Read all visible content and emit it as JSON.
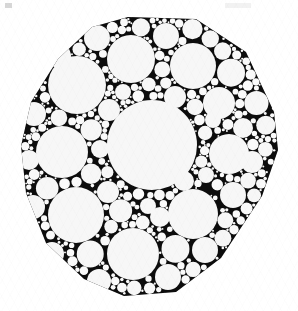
{
  "figure": {
    "kind": "circle-packing-diagram",
    "caption": "",
    "canvas": {
      "width": 298,
      "height": 311
    },
    "colors": {
      "ink": "#080808",
      "paper": "#ffffff",
      "disk_fill": "#f7f7f7",
      "disk_fill_small": "#fafafa",
      "texture": "#f2f2f2"
    },
    "outline": {
      "label": "hexagonal packing boundary",
      "points": [
        [
          128,
          17
        ],
        [
          196,
          19
        ],
        [
          246,
          52
        ],
        [
          274,
          112
        ],
        [
          278,
          150
        ],
        [
          262,
          196
        ],
        [
          221,
          258
        ],
        [
          176,
          292
        ],
        [
          124,
          296
        ],
        [
          84,
          279
        ],
        [
          46,
          243
        ],
        [
          26,
          193
        ],
        [
          21,
          146
        ],
        [
          31,
          102
        ],
        [
          58,
          59
        ],
        [
          92,
          27
        ]
      ]
    },
    "background_fill_radius": 0,
    "artifacts": [
      {
        "name": "scan-speck-top-left",
        "x": 5,
        "y": 3,
        "w": 7,
        "h": 5,
        "opacity": 0.16
      },
      {
        "name": "scan-smudge-top-right",
        "x": 225,
        "y": 3,
        "w": 26,
        "h": 5,
        "opacity": 0.05
      }
    ],
    "disks": [
      {
        "cx": 152,
        "cy": 145,
        "r": 45,
        "tier": "primary"
      },
      {
        "cx": 77,
        "cy": 85,
        "r": 29,
        "tier": "primary"
      },
      {
        "cx": 131,
        "cy": 59,
        "r": 24,
        "tier": "primary"
      },
      {
        "cx": 193,
        "cy": 66,
        "r": 23,
        "tier": "primary"
      },
      {
        "cx": 62,
        "cy": 152,
        "r": 26,
        "tier": "primary"
      },
      {
        "cx": 76,
        "cy": 215,
        "r": 28,
        "tier": "primary"
      },
      {
        "cx": 133,
        "cy": 254,
        "r": 26,
        "tier": "primary"
      },
      {
        "cx": 193,
        "cy": 214,
        "r": 25,
        "tier": "primary"
      },
      {
        "cx": 229,
        "cy": 154,
        "r": 20,
        "tier": "primary"
      },
      {
        "cx": 97,
        "cy": 38,
        "r": 13,
        "tier": "secondary"
      },
      {
        "cx": 166,
        "cy": 36,
        "r": 13,
        "tier": "secondary"
      },
      {
        "cx": 219,
        "cy": 103,
        "r": 16,
        "tier": "secondary"
      },
      {
        "cx": 243,
        "cy": 128,
        "r": 10,
        "tier": "secondary"
      },
      {
        "cx": 252,
        "cy": 162,
        "r": 11,
        "tier": "secondary"
      },
      {
        "cx": 233,
        "cy": 195,
        "r": 13,
        "tier": "secondary"
      },
      {
        "cx": 205,
        "cy": 250,
        "r": 13,
        "tier": "secondary"
      },
      {
        "cx": 168,
        "cy": 277,
        "r": 13,
        "tier": "secondary"
      },
      {
        "cx": 99,
        "cy": 281,
        "r": 12,
        "tier": "secondary"
      },
      {
        "cx": 52,
        "cy": 254,
        "r": 12,
        "tier": "secondary"
      },
      {
        "cx": 33,
        "cy": 207,
        "r": 12,
        "tier": "secondary"
      },
      {
        "cx": 29,
        "cy": 160,
        "r": 10,
        "tier": "secondary"
      },
      {
        "cx": 34,
        "cy": 114,
        "r": 12,
        "tier": "secondary"
      },
      {
        "cx": 59,
        "cy": 56,
        "r": 12,
        "tier": "secondary"
      },
      {
        "cx": 109,
        "cy": 110,
        "r": 11,
        "tier": "secondary"
      },
      {
        "cx": 175,
        "cy": 97,
        "r": 11,
        "tier": "secondary"
      },
      {
        "cx": 108,
        "cy": 192,
        "r": 11,
        "tier": "secondary"
      },
      {
        "cx": 184,
        "cy": 181,
        "r": 10,
        "tier": "secondary"
      },
      {
        "cx": 160,
        "cy": 217,
        "r": 10,
        "tier": "secondary"
      },
      {
        "cx": 213,
        "cy": 120,
        "r": 8,
        "tier": "tertiary"
      },
      {
        "cx": 100,
        "cy": 149,
        "r": 9,
        "tier": "tertiary"
      },
      {
        "cx": 206,
        "cy": 175,
        "r": 8,
        "tier": "tertiary"
      },
      {
        "cx": 148,
        "cy": 206,
        "r": 8,
        "tier": "tertiary"
      },
      {
        "cx": 123,
        "cy": 92,
        "r": 8,
        "tier": "tertiary"
      }
    ],
    "recursion": {
      "label": "gasket subdivision",
      "max_depth": 4,
      "min_radius_px": 0.9,
      "gap_fill_ratio": 0.46
    },
    "legend": [],
    "axes": null
  }
}
